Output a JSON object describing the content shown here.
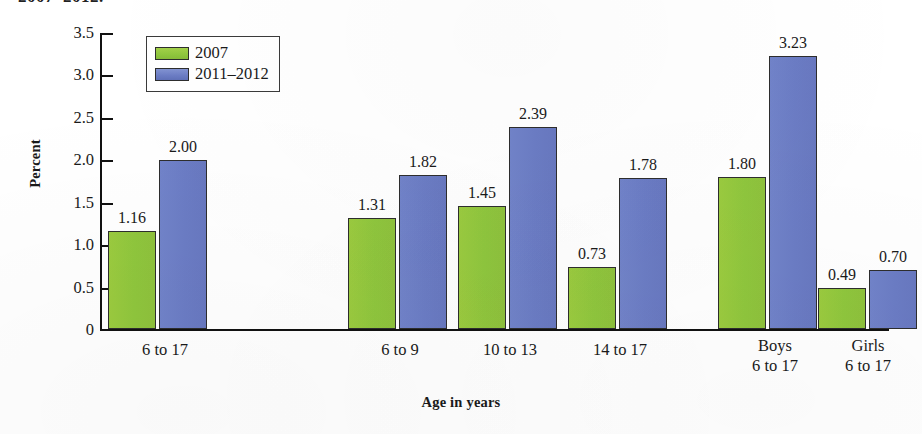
{
  "figure": {
    "cropped_title_line": "2007–2012.",
    "x_axis_title": "Age in years",
    "y_axis_title": "Percent"
  },
  "legend": {
    "items": [
      {
        "label": "2007",
        "color": "#8fc63d"
      },
      {
        "label": "2011–2012",
        "color": "#6b7cc4"
      }
    ]
  },
  "chart_data": {
    "type": "bar",
    "title": "2007–2012.",
    "xlabel": "Age in years",
    "ylabel": "Percent",
    "ylim": [
      0,
      3.5
    ],
    "ytick_labels": [
      "0",
      "0.5",
      "1.0",
      "1.5",
      "2.0",
      "2.5",
      "3.0",
      "3.5"
    ],
    "ytick_values": [
      0,
      0.5,
      1.0,
      1.5,
      2.0,
      2.5,
      3.0,
      3.5
    ],
    "grid": false,
    "legend_position": "top-left inside plot",
    "categories": [
      "6 to 17",
      "6 to 9",
      "10 to 13",
      "14 to 17",
      "Boys\n6 to 17",
      "Girls\n6 to 17"
    ],
    "series": [
      {
        "name": "2007",
        "color": "#8fc63d",
        "values": [
          1.16,
          1.31,
          1.45,
          0.73,
          1.8,
          0.49
        ]
      },
      {
        "name": "2011–2012",
        "color": "#6b7cc4",
        "values": [
          2.0,
          1.82,
          2.39,
          1.78,
          3.23,
          0.7
        ]
      }
    ],
    "value_labels": {
      "2007": [
        "1.16",
        "1.31",
        "1.45",
        "0.73",
        "1.80",
        "0.49"
      ],
      "2011–2012": [
        "2.00",
        "1.82",
        "2.39",
        "1.78",
        "3.23",
        "0.70"
      ]
    }
  },
  "layout": {
    "group_left_px": [
      108,
      348,
      458,
      568,
      718,
      818
    ],
    "group_width_px": [
      114,
      104,
      104,
      104,
      114,
      100
    ],
    "bar_width_px": 48,
    "bar_gap_px": 3,
    "group_label_tops": [
      340,
      340,
      340,
      340,
      336,
      336
    ]
  }
}
